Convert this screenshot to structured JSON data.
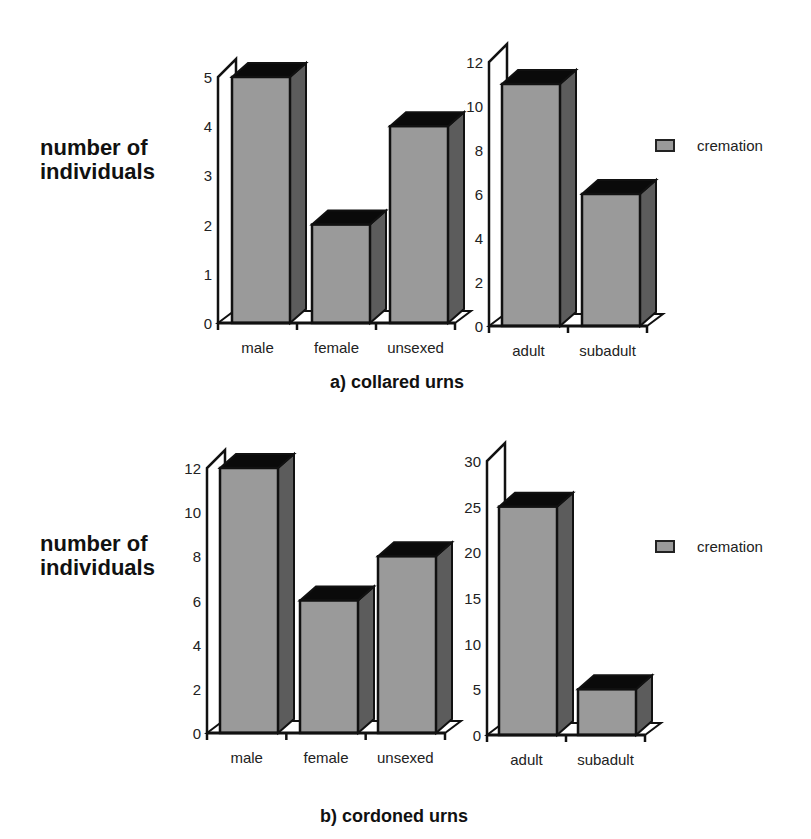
{
  "chart_data": [
    {
      "type": "bar",
      "title": "a) collared urns",
      "ylabel": "number of individuals",
      "subplots": [
        {
          "categories": [
            "male",
            "female",
            "unsexed"
          ],
          "values": [
            5,
            2,
            4
          ],
          "ylim": [
            0,
            5
          ],
          "yticks": [
            0,
            1,
            2,
            3,
            4,
            5
          ]
        },
        {
          "categories": [
            "adult",
            "subadult"
          ],
          "values": [
            11,
            6
          ],
          "ylim": [
            0,
            12
          ],
          "yticks": [
            0,
            2,
            4,
            6,
            8,
            10,
            12
          ]
        }
      ],
      "legend": [
        "cremation"
      ],
      "style": "3d-bar"
    },
    {
      "type": "bar",
      "title": "b) cordoned urns",
      "ylabel": "number of individuals",
      "subplots": [
        {
          "categories": [
            "male",
            "female",
            "unsexed"
          ],
          "values": [
            12,
            6,
            8
          ],
          "ylim": [
            0,
            12
          ],
          "yticks": [
            0,
            2,
            4,
            6,
            8,
            10,
            12
          ]
        },
        {
          "categories": [
            "adult",
            "subadult"
          ],
          "values": [
            25,
            5
          ],
          "ylim": [
            0,
            30
          ],
          "yticks": [
            0,
            5,
            10,
            15,
            20,
            25,
            30
          ]
        }
      ],
      "legend": [
        "cremation"
      ],
      "style": "3d-bar"
    }
  ],
  "labels": {
    "ylabel_line1": "number of",
    "ylabel_line2": "individuals",
    "title_a": "a) collared urns",
    "title_b": "b) cordoned urns",
    "legend_label": "cremation"
  },
  "colors": {
    "front": "#9a9a9a",
    "side": "#5c5c5c",
    "top": "#0a0a0a",
    "outline": "#111111"
  }
}
